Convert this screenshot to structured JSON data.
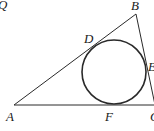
{
  "diagram": {
    "type": "geometry",
    "labels": {
      "Q": "Q",
      "A": "A",
      "B": "B",
      "C": "C",
      "D": "D",
      "E": "E",
      "F": "F"
    },
    "points": {
      "A": [
        14,
        105
      ],
      "B": [
        136,
        14
      ],
      "C": [
        155,
        105
      ],
      "D": [
        96,
        42
      ],
      "E": [
        146,
        68
      ],
      "F": [
        112,
        105
      ]
    },
    "incircle": {
      "cx": 114,
      "cy": 72,
      "r": 32
    },
    "colors": {
      "stroke": "#2a2a2a",
      "text": "#1a1a1a",
      "background": "#ffffff"
    }
  }
}
